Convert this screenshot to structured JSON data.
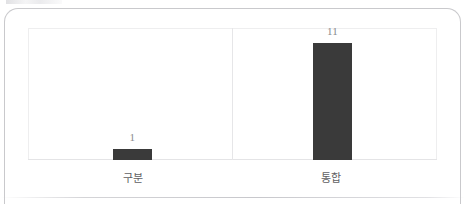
{
  "chart_data": {
    "type": "bar",
    "title": "",
    "subtitle": "",
    "xlabel": "",
    "ylabel": "",
    "categories": [
      "구분",
      "통합"
    ],
    "values": [
      1,
      11
    ],
    "value_labels": [
      "1",
      "11"
    ],
    "ylim": [
      0,
      12
    ],
    "grid": false,
    "legend": false,
    "series": [
      {
        "name": "",
        "values": [
          1,
          11
        ]
      }
    ],
    "colors": {
      "bar": "#3a3a3a",
      "plot_border": "#eeeeef",
      "axis_line": "#e4e4e6",
      "divider": "#e6e6e8",
      "value_label": "#8a8a8e",
      "category_label": "#5f5f63",
      "card_border": "#c9c9cc",
      "background": "#ffffff"
    }
  },
  "chart": {
    "bars": [
      {
        "category": "구분",
        "value_label": "1"
      },
      {
        "category": "통합",
        "value_label": "11"
      }
    ]
  }
}
